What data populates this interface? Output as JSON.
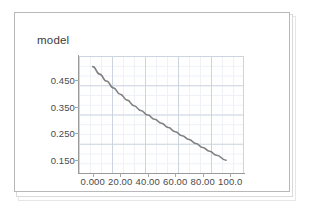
{
  "chart_data": {
    "type": "line",
    "title": "model",
    "xlabel": "",
    "ylabel": "",
    "xlim": [
      -10,
      110
    ],
    "ylim": [
      0.1,
      0.54
    ],
    "grid": true,
    "legend_position": "none",
    "x_tick_labels": [
      "0.000",
      "20.00",
      "40.00",
      "60.00",
      "80.00",
      "100.0"
    ],
    "x_tick_values": [
      0,
      20,
      40,
      60,
      80,
      100
    ],
    "y_tick_labels": [
      "0.450",
      "0.350",
      "0.250",
      "0.150"
    ],
    "y_tick_values": [
      0.45,
      0.35,
      0.25,
      0.15
    ],
    "series": [
      {
        "name": "model",
        "color": "#808080",
        "x": [
          0,
          5,
          10,
          15,
          20,
          25,
          30,
          35,
          40,
          45,
          50,
          55,
          60,
          65,
          70,
          75,
          80,
          85,
          90,
          97
        ],
        "values": [
          0.5,
          0.472,
          0.446,
          0.42,
          0.396,
          0.374,
          0.353,
          0.335,
          0.318,
          0.302,
          0.287,
          0.271,
          0.255,
          0.24,
          0.226,
          0.211,
          0.196,
          0.182,
          0.167,
          0.148
        ]
      }
    ],
    "annotations": []
  },
  "chart": {
    "title": "model",
    "line_color": "#808080",
    "grid_major_color": "#ccd4e0",
    "grid_minor_color": "#eef1f6",
    "axis_color": "#9a9a9a",
    "tick_label_color": "#4a4a4a",
    "panel_background": "#ffffff",
    "panel_border_color": "#b8b8b8"
  }
}
